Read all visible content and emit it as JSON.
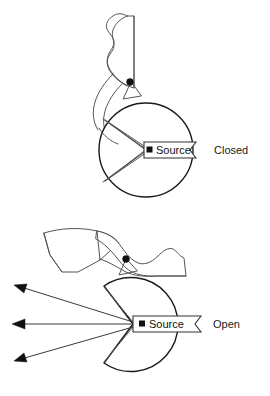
{
  "figure": {
    "title": "",
    "background_color": "#ffffff",
    "line_color": "#1a1a1a",
    "accent_color": "#555555",
    "width": 270,
    "height": 396
  },
  "panels": [
    {
      "id": "closed",
      "caption": "Closed",
      "source_label": "Source",
      "source_marker_icon": "square-marker-icon",
      "shutter_state": "closed",
      "beam_count": 0,
      "housing_shape": "full-circle",
      "housing_center": [
        146,
        150
      ],
      "housing_radius": 47,
      "caption_position": [
        214,
        152
      ]
    },
    {
      "id": "open",
      "caption": "Open",
      "source_label": "Source",
      "source_marker_icon": "square-marker-icon",
      "shutter_state": "open",
      "beam_count": 3,
      "housing_shape": "circle-with-wedge-cut",
      "housing_center": [
        152,
        324
      ],
      "housing_radius": 47,
      "caption_position": [
        213,
        326
      ],
      "beams": [
        {
          "from": [
            133,
            324
          ],
          "to": [
            17,
            287
          ]
        },
        {
          "from": [
            133,
            324
          ],
          "to": [
            14,
            324
          ]
        },
        {
          "from": [
            133,
            324
          ],
          "to": [
            17,
            360
          ]
        }
      ]
    }
  ],
  "colors": {
    "stroke_dark": "#1a1a1a",
    "stroke_mid": "#555555",
    "fill_white": "#ffffff",
    "marker_black": "#111111"
  }
}
